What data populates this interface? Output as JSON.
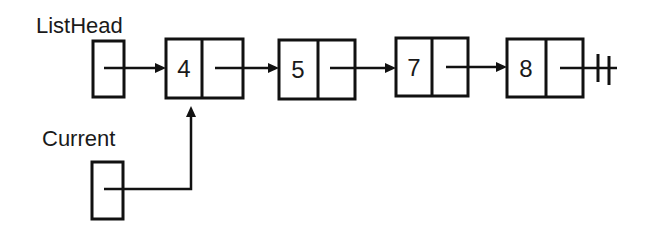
{
  "diagram": {
    "labels": {
      "list_head": "ListHead",
      "current": "Current"
    },
    "nodes": [
      {
        "value": "4"
      },
      {
        "value": "5"
      },
      {
        "value": "7"
      },
      {
        "value": "8"
      }
    ],
    "pointers": {
      "list_head_points_to": "4",
      "current_points_to": "4",
      "last_next": "null"
    },
    "icons": {
      "null_terminator": "null-ground-icon",
      "arrow": "arrow-right-icon"
    },
    "colors": {
      "stroke": "#111111",
      "text": "#1a1a1a",
      "background": "#ffffff"
    }
  }
}
